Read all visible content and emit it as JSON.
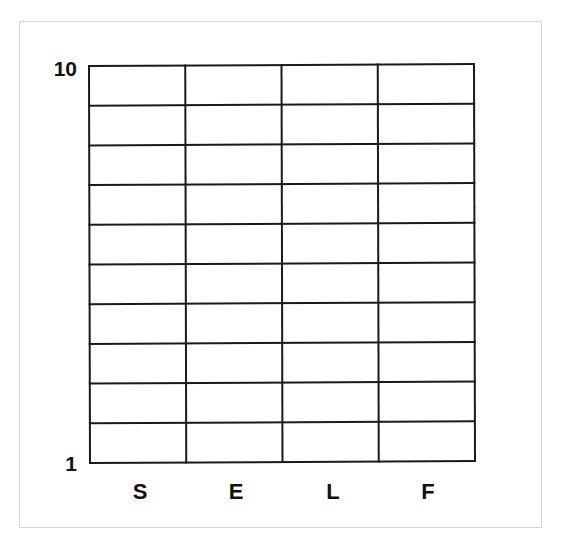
{
  "chart_data": {
    "type": "heatmap",
    "title": "",
    "xlabel": "",
    "ylabel": "",
    "categories": [
      "S",
      "E",
      "L",
      "F"
    ],
    "y_tick_labels": [
      "10",
      "1"
    ],
    "ylim": [
      1,
      10
    ],
    "rows": 10,
    "columns": 4,
    "cells_filled": [],
    "grid": true,
    "legend": null
  },
  "axis": {
    "y_top_label": "10",
    "y_bottom_label": "1",
    "x_labels": [
      "S",
      "E",
      "L",
      "F"
    ]
  },
  "style": {
    "line_color": "#1a1a1a",
    "frame_color": "#d6d6d6",
    "background": "#ffffff"
  }
}
